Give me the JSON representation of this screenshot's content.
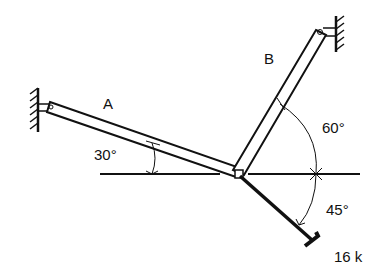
{
  "diagram": {
    "members": [
      {
        "id": "A",
        "label": "A",
        "angle_label": "30°"
      },
      {
        "id": "B",
        "label": "B",
        "angle_label": "60°"
      }
    ],
    "load": {
      "angle_label": "45°",
      "magnitude_label": "16 k"
    }
  }
}
